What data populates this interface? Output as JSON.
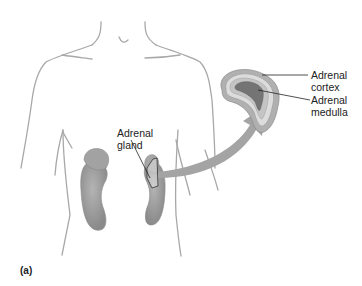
{
  "figure": {
    "panel_label": "(a)",
    "labels": {
      "adrenal_gland": [
        "Adrenal",
        "gland"
      ],
      "adrenal_cortex": [
        "Adrenal",
        "cortex"
      ],
      "adrenal_medulla": [
        "Adrenal",
        "medulla"
      ]
    },
    "colors": {
      "outline": "#a8a8a8",
      "kidney": "#9a9a9a",
      "arrow": "#a0a0a0",
      "cortex_light": "#d8d8d8",
      "medulla_dark": "#707070",
      "text": "#222222"
    }
  }
}
